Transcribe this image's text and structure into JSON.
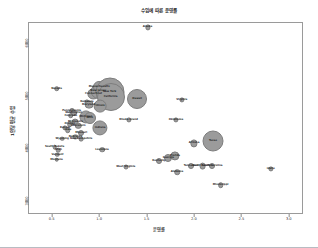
{
  "chart_data": {
    "type": "scatter",
    "title": "수입에 따른 운영률",
    "xlabel": "운영률",
    "ylabel": "1인당 평균 수입",
    "xlim": [
      0.25,
      3.15
    ],
    "ylim": [
      2750,
      6400
    ],
    "xticks": [
      "0.5",
      "1.0",
      "1.5",
      "2.0",
      "2.5",
      "3.0"
    ],
    "xtickvals": [
      0.5,
      1.0,
      1.5,
      2.0,
      2.5,
      3.0
    ],
    "yticks": [
      "6000",
      "5000",
      "4000",
      "3000"
    ],
    "ytickvals": [
      6000,
      5000,
      4000,
      3000
    ],
    "grid": false,
    "legend": null,
    "size_encoding": "population",
    "bubble_color": "#9b9b9b",
    "points": [
      {
        "label": "Alaska",
        "x": 1.5,
        "y": 6315,
        "size": 1.6
      },
      {
        "label": "Nevada",
        "x": 0.54,
        "y": 5150,
        "size": 1.8
      },
      {
        "label": "Connecticut",
        "x": 0.93,
        "y": 5050,
        "size": 4.6
      },
      {
        "label": "New Jersey",
        "x": 0.98,
        "y": 5100,
        "size": 6.2
      },
      {
        "label": "Massachusetts",
        "x": 0.99,
        "y": 5180,
        "size": 5.0
      },
      {
        "label": "New York",
        "x": 1.1,
        "y": 5080,
        "size": 13.5
      },
      {
        "label": "California",
        "x": 1.11,
        "y": 5000,
        "size": 13.0
      },
      {
        "label": "Delaware",
        "x": 0.86,
        "y": 4900,
        "size": 1.6
      },
      {
        "label": "Maryland",
        "x": 0.88,
        "y": 4850,
        "size": 3.4
      },
      {
        "label": "Hawaii",
        "x": 1.39,
        "y": 4950,
        "size": 9.0
      },
      {
        "label": "Illinois",
        "x": 1.0,
        "y": 4820,
        "size": 5.4
      },
      {
        "label": "Pennsylvania",
        "x": 0.7,
        "y": 4720,
        "size": 2.0
      },
      {
        "label": "Washington",
        "x": 0.72,
        "y": 4680,
        "size": 2.0
      },
      {
        "label": "Colorado",
        "x": 0.69,
        "y": 4640,
        "size": 1.8
      },
      {
        "label": "Michigan",
        "x": 0.85,
        "y": 4620,
        "size": 5.6
      },
      {
        "label": "Ohio",
        "x": 0.89,
        "y": 4600,
        "size": 5.0
      },
      {
        "label": "Rhode Island",
        "x": 1.3,
        "y": 4560,
        "size": 1.6
      },
      {
        "label": "Minnesota",
        "x": 0.74,
        "y": 4520,
        "size": 2.4
      },
      {
        "label": "Oregon",
        "x": 0.68,
        "y": 4480,
        "size": 1.8
      },
      {
        "label": "Wisconsin",
        "x": 0.77,
        "y": 4440,
        "size": 2.2
      },
      {
        "label": "Indiana",
        "x": 1.0,
        "y": 4400,
        "size": 6.6
      },
      {
        "label": "Kansas",
        "x": 0.63,
        "y": 4400,
        "size": 1.6
      },
      {
        "label": "Iowa",
        "x": 0.66,
        "y": 4360,
        "size": 1.8
      },
      {
        "label": "Missouri",
        "x": 0.8,
        "y": 4300,
        "size": 2.0
      },
      {
        "label": "Nebraska",
        "x": 0.74,
        "y": 4240,
        "size": 1.6
      },
      {
        "label": "New Hampshire",
        "x": 0.8,
        "y": 4200,
        "size": 1.4
      },
      {
        "label": "Wyoming",
        "x": 0.6,
        "y": 4200,
        "size": 1.3
      },
      {
        "label": "Virginia",
        "x": 1.86,
        "y": 4940,
        "size": 1.6
      },
      {
        "label": "Oklahoma",
        "x": 1.8,
        "y": 4560,
        "size": 1.6
      },
      {
        "label": "Texas",
        "x": 2.19,
        "y": 4150,
        "size": 9.5
      },
      {
        "label": "Arizona",
        "x": 1.99,
        "y": 4110,
        "size": 2.6
      },
      {
        "label": "South Dakota",
        "x": 0.52,
        "y": 4040,
        "size": 1.3
      },
      {
        "label": "Utah",
        "x": 0.56,
        "y": 3980,
        "size": 1.3
      },
      {
        "label": "Vermont",
        "x": 0.55,
        "y": 3900,
        "size": 1.3
      },
      {
        "label": "Montana",
        "x": 0.54,
        "y": 3800,
        "size": 1.3
      },
      {
        "label": "Louisiana",
        "x": 1.02,
        "y": 3990,
        "size": 1.8
      },
      {
        "label": "Florida",
        "x": 1.79,
        "y": 3870,
        "size": 3.6
      },
      {
        "label": "Georgia",
        "x": 1.72,
        "y": 3840,
        "size": 3.0
      },
      {
        "label": "Kentucky",
        "x": 1.62,
        "y": 3780,
        "size": 2.0
      },
      {
        "label": "West Virginia",
        "x": 1.27,
        "y": 3660,
        "size": 1.5
      },
      {
        "label": "Tennessee",
        "x": 1.96,
        "y": 3680,
        "size": 2.0
      },
      {
        "label": "North Carolina",
        "x": 2.08,
        "y": 3680,
        "size": 2.4
      },
      {
        "label": "South Carolina",
        "x": 2.18,
        "y": 3680,
        "size": 2.0
      },
      {
        "label": "Idaho",
        "x": 2.8,
        "y": 3620,
        "size": 1.6
      },
      {
        "label": "Alabama",
        "x": 1.81,
        "y": 3560,
        "size": 1.8
      },
      {
        "label": "Mississippi",
        "x": 2.27,
        "y": 3320,
        "size": 1.8
      }
    ]
  }
}
